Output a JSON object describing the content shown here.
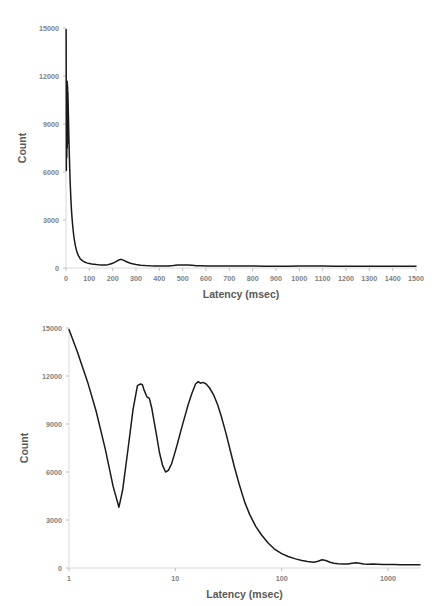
{
  "figures": [
    {
      "id": "linear-latency-histogram",
      "chart_data": {
        "type": "line",
        "title": "",
        "xlabel": "Latency (msec)",
        "ylabel": "Count",
        "xscale": "linear",
        "yscale": "linear",
        "xlim": [
          0,
          1500
        ],
        "ylim": [
          0,
          15000
        ],
        "grid": false,
        "legend": "none",
        "xticks": [
          0,
          100,
          200,
          300,
          400,
          500,
          600,
          700,
          800,
          900,
          1000,
          1100,
          1200,
          1300,
          1400,
          1500
        ],
        "xticklabels": [
          "0",
          "100",
          "200",
          "300",
          "400",
          "500",
          "600",
          "700",
          "800",
          "900",
          "1000",
          "1100",
          "1200",
          "1300",
          "1400",
          "1500"
        ],
        "yticks": [
          0,
          3000,
          6000,
          9000,
          12000,
          15000
        ],
        "yticklabels": [
          "0",
          "3000",
          "6000",
          "9000",
          "12000",
          "15000"
        ],
        "series": [
          {
            "name": "Latency count",
            "color": "#1a1a1a",
            "x": [
              0.5,
              1,
              1.5,
              2,
              2.5,
              3,
              3.5,
              4,
              4.5,
              5,
              5.5,
              6,
              6.5,
              7,
              7.5,
              8,
              9,
              10,
              11,
              12,
              13,
              14,
              15,
              16,
              17,
              18,
              20,
              22,
              24,
              26,
              28,
              30,
              33,
              36,
              40,
              45,
              50,
              55,
              60,
              65,
              70,
              75,
              80,
              85,
              90,
              95,
              100,
              110,
              120,
              130,
              140,
              150,
              160,
              170,
              180,
              190,
              200,
              210,
              220,
              230,
              235,
              240,
              250,
              260,
              270,
              280,
              290,
              300,
              320,
              340,
              360,
              380,
              400,
              420,
              440,
              460,
              470,
              480,
              490,
              500,
              510,
              520,
              540,
              560,
              580,
              600,
              640,
              680,
              700,
              720,
              740,
              760,
              800,
              850,
              900,
              950,
              1000,
              1050,
              1100,
              1150,
              1200,
              1250,
              1300,
              1350,
              1400,
              1450,
              1500
            ],
            "y": [
              14900,
              11600,
              6100,
              11500,
              8400,
              11700,
              6900,
              11600,
              9200,
              11650,
              7500,
              11500,
              8900,
              11300,
              7800,
              11000,
              10400,
              9700,
              9100,
              8400,
              7800,
              7200,
              6700,
              6200,
              5700,
              5300,
              4600,
              4000,
              3500,
              3100,
              2750,
              2450,
              2050,
              1750,
              1400,
              1100,
              880,
              720,
              600,
              520,
              460,
              410,
              375,
              345,
              320,
              300,
              285,
              255,
              235,
              215,
              200,
              190,
              185,
              190,
              210,
              250,
              300,
              370,
              450,
              520,
              540,
              525,
              460,
              390,
              330,
              280,
              245,
              215,
              175,
              150,
              135,
              128,
              125,
              125,
              130,
              150,
              165,
              180,
              190,
              195,
              192,
              185,
              165,
              148,
              135,
              128,
              120,
              118,
              120,
              125,
              128,
              126,
              120,
              115,
              112,
              112,
              118,
              120,
              118,
              115,
              112,
              110,
              110,
              108,
              110,
              112,
              112
            ]
          }
        ]
      }
    },
    {
      "id": "log-latency-histogram",
      "chart_data": {
        "type": "line",
        "title": "",
        "xlabel": "Latency (msec)",
        "ylabel": "Count",
        "xscale": "log",
        "yscale": "linear",
        "xlim": [
          1,
          2000
        ],
        "ylim": [
          0,
          15000
        ],
        "grid": false,
        "legend": "none",
        "xticks": [
          1,
          10,
          100,
          1000
        ],
        "xticklabels": [
          "1",
          "10",
          "100",
          "1000"
        ],
        "yticks": [
          0,
          3000,
          6000,
          9000,
          12000,
          15000
        ],
        "yticklabels": [
          "0",
          "3000",
          "6000",
          "9000",
          "12000",
          "15000"
        ],
        "series": [
          {
            "name": "Latency count",
            "color": "#1a1a1a",
            "x": [
              1.0,
              1.2,
              1.5,
              1.8,
              2.2,
              2.6,
              2.95,
              3.2,
              3.6,
              4.0,
              4.4,
              4.7,
              4.9,
              5.1,
              5.4,
              5.7,
              6.0,
              6.3,
              6.7,
              7.1,
              7.6,
              8.1,
              8.6,
              9.2,
              9.8,
              10.5,
              11.3,
              12.2,
              13.2,
              14.3,
              15.5,
              16.4,
              17.2,
              18.2,
              19.5,
              21,
              23,
              25,
              27,
              30,
              33,
              36,
              40,
              45,
              50,
              57,
              65,
              75,
              85,
              100,
              115,
              135,
              155,
              175,
              200,
              220,
              240,
              260,
              285,
              310,
              340,
              380,
              420,
              460,
              500,
              540,
              590,
              650,
              720,
              800,
              900,
              1000,
              1150,
              1300,
              1500,
              1700,
              2000
            ],
            "y": [
              14900,
              13500,
              11600,
              9800,
              7400,
              5100,
              3800,
              4900,
              7500,
              9900,
              11400,
              11500,
              11450,
              11100,
              10700,
              10600,
              10000,
              9200,
              8200,
              7200,
              6400,
              6000,
              6100,
              6500,
              7100,
              7800,
              8600,
              9400,
              10200,
              10900,
              11500,
              11650,
              11550,
              11600,
              11500,
              11250,
              10800,
              10200,
              9500,
              8400,
              7300,
              6300,
              5200,
              4100,
              3350,
              2600,
              2050,
              1550,
              1200,
              900,
              720,
              570,
              470,
              400,
              360,
              420,
              520,
              470,
              360,
              300,
              270,
              250,
              255,
              300,
              330,
              300,
              250,
              240,
              245,
              235,
              225,
              220,
              215,
              210,
              205,
              200,
              200
            ]
          }
        ]
      }
    }
  ]
}
